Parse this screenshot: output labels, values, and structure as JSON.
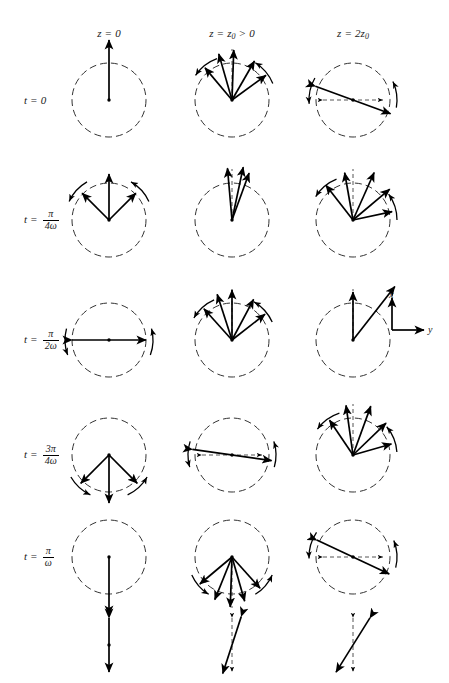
{
  "figure": {
    "background": "#ffffff",
    "ink_color": "#000000",
    "dashed_color": "#555555"
  },
  "columns": [
    {
      "id": "z0",
      "label_plain": "z = 0",
      "var": "z",
      "eq": "=",
      "value": "0",
      "center_x": 109
    },
    {
      "id": "zz0",
      "label_plain": "z = z0 > 0",
      "var": "z",
      "eq": "=",
      "value": "z",
      "sub": "0",
      "rel": ">",
      "rel_value": "0",
      "center_x": 232
    },
    {
      "id": "z2z0",
      "label_plain": "z = 2z0",
      "var": "z",
      "eq": "=",
      "value": "2z",
      "sub": "0",
      "center_x": 353
    }
  ],
  "column_header_y": 27,
  "rows": [
    {
      "id": "t0",
      "label_plain": "t = 0",
      "var": "t",
      "eq": "=",
      "kind": "plain",
      "value": "0",
      "center_y": 100
    },
    {
      "id": "tpi4w",
      "label_plain": "t = pi/4w",
      "var": "t",
      "eq": "=",
      "kind": "frac",
      "num": "π",
      "den": "4ω",
      "center_y": 220
    },
    {
      "id": "tpi2w",
      "label_plain": "t = pi/2w",
      "var": "t",
      "eq": "=",
      "kind": "frac",
      "num": "π",
      "den": "2ω",
      "center_y": 340
    },
    {
      "id": "t3pi4w",
      "label_plain": "t = 3pi/4w",
      "var": "t",
      "eq": "=",
      "kind": "frac",
      "num": "3π",
      "den": "4ω",
      "center_y": 455
    },
    {
      "id": "tpiw",
      "label_plain": "t = pi/w",
      "var": "t",
      "eq": "=",
      "kind": "frac",
      "num": "π",
      "den": "ω",
      "center_y": 557
    }
  ],
  "row_label_x": 24,
  "circle_radius": 37,
  "axes_legend": {
    "x_label": "x",
    "y_label": "y",
    "origin_x": 392,
    "origin_y": 330,
    "x_arrow_length": 32,
    "y_arrow_length": 32
  },
  "summary_row": {
    "center_y": 645,
    "items": [
      {
        "id": "sum-z0",
        "description": "linear vertical double arrow",
        "center_x": 109
      },
      {
        "id": "sum-zz0",
        "description": "narrow crossed double arrows",
        "center_x": 232
      },
      {
        "id": "sum-z2z0",
        "description": "wide crossed double arrows",
        "center_x": 353
      }
    ]
  },
  "cells": [
    {
      "row": "t0",
      "col": "z0",
      "name": "cell-t0-z0",
      "description": "single long vertical arrow pointing up from center",
      "vectors": [
        {
          "angle_deg": 90,
          "length": 60
        }
      ],
      "arcs": []
    },
    {
      "row": "t0",
      "col": "zz0",
      "name": "cell-t0-zz0",
      "description": "fan of five arrows spanning upper half, tangential arc arrows",
      "vectors": [
        {
          "angle_deg": 130,
          "length": 42
        },
        {
          "angle_deg": 106,
          "length": 48
        },
        {
          "angle_deg": 88,
          "length": 50
        },
        {
          "angle_deg": 60,
          "length": 45
        },
        {
          "angle_deg": 36,
          "length": 42
        }
      ],
      "dashed_ref_angle_deg": 90,
      "arcs": [
        {
          "start_deg": 110,
          "end_deg": 146,
          "dir": "ccw"
        },
        {
          "start_deg": 22,
          "end_deg": 58,
          "dir": "cw"
        }
      ]
    },
    {
      "row": "t0",
      "col": "z2z0",
      "name": "cell-t0-z2z0",
      "description": "diagonal double-headed arrow plus horizontal dashed double arrow",
      "double_vectors": [
        {
          "angle_deg": 160,
          "length": 40
        }
      ],
      "dashed_double": {
        "angle_deg": 180,
        "length": 30
      },
      "arcs": [
        {
          "start_deg": 150,
          "end_deg": 185,
          "dir": "ccw"
        },
        {
          "start_deg": -10,
          "end_deg": 25,
          "dir": "cw"
        }
      ]
    },
    {
      "row": "tpi4w",
      "col": "z0",
      "name": "cell-tpi4w-z0",
      "description": "two symmetric arrows forming a V with central vertical arrow",
      "vectors": [
        {
          "angle_deg": 135,
          "length": 38
        },
        {
          "angle_deg": 90,
          "length": 46
        },
        {
          "angle_deg": 45,
          "length": 38
        }
      ],
      "arcs": [
        {
          "start_deg": 120,
          "end_deg": 155,
          "dir": "ccw"
        },
        {
          "start_deg": 25,
          "end_deg": 60,
          "dir": "cw"
        }
      ]
    },
    {
      "row": "tpi4w",
      "col": "zz0",
      "name": "cell-tpi4w-zz0",
      "description": "tight cluster of near vertical arrows tilted right",
      "vectors": [
        {
          "angle_deg": 95,
          "length": 52
        },
        {
          "angle_deg": 78,
          "length": 54
        },
        {
          "angle_deg": 70,
          "length": 50
        }
      ],
      "dashed_ref_angle_deg": 90,
      "arcs": []
    },
    {
      "row": "tpi4w",
      "col": "z2z0",
      "name": "cell-tpi4w-z2z0",
      "description": "wide fan of arrows from center toward upper right with arcs",
      "vectors": [
        {
          "angle_deg": 128,
          "length": 44
        },
        {
          "angle_deg": 100,
          "length": 48
        },
        {
          "angle_deg": 66,
          "length": 52
        },
        {
          "angle_deg": 40,
          "length": 48
        },
        {
          "angle_deg": 12,
          "length": 40
        }
      ],
      "dashed_ref_angle_deg": 90,
      "arcs": [
        {
          "start_deg": 112,
          "end_deg": 148,
          "dir": "ccw"
        },
        {
          "start_deg": 0,
          "end_deg": 36,
          "dir": "cw"
        }
      ]
    },
    {
      "row": "tpi2w",
      "col": "z0",
      "name": "cell-tpi2w-z0",
      "description": "horizontal double-headed arrow through center",
      "double_vectors": [
        {
          "angle_deg": 180,
          "length": 37
        }
      ],
      "arcs": [
        {
          "start_deg": 165,
          "end_deg": 200,
          "dir": "ccw"
        },
        {
          "start_deg": -20,
          "end_deg": 15,
          "dir": "cw"
        }
      ]
    },
    {
      "row": "tpi2w",
      "col": "zz0",
      "name": "cell-tpi2w-zz0",
      "description": "fan of five arrows upward, same pattern as t=0 z=z0",
      "vectors": [
        {
          "angle_deg": 132,
          "length": 42
        },
        {
          "angle_deg": 108,
          "length": 48
        },
        {
          "angle_deg": 90,
          "length": 50
        },
        {
          "angle_deg": 62,
          "length": 46
        },
        {
          "angle_deg": 38,
          "length": 42
        }
      ],
      "dashed_ref_angle_deg": 90,
      "arcs": [
        {
          "start_deg": 114,
          "end_deg": 150,
          "dir": "ccw"
        },
        {
          "start_deg": 24,
          "end_deg": 60,
          "dir": "cw"
        }
      ]
    },
    {
      "row": "tpi2w",
      "col": "z2z0",
      "name": "cell-tpi2w-z2z0",
      "description": "long arrow to upper right and short vertical arrow",
      "vectors": [
        {
          "angle_deg": 90,
          "length": 48
        },
        {
          "angle_deg": 52,
          "length": 68
        }
      ],
      "dashed_ref_angle_deg": 90,
      "arcs": []
    },
    {
      "row": "t3pi4w",
      "col": "z0",
      "name": "cell-t3pi4w-z0",
      "description": "inverted V of two arrows with central downward arrow",
      "vectors": [
        {
          "angle_deg": -135,
          "length": 40
        },
        {
          "angle_deg": -90,
          "length": 48
        },
        {
          "angle_deg": -45,
          "length": 40
        }
      ],
      "arcs": [
        {
          "start_deg": -150,
          "end_deg": -115,
          "dir": "cw"
        },
        {
          "start_deg": -65,
          "end_deg": -30,
          "dir": "ccw"
        }
      ]
    },
    {
      "row": "t3pi4w",
      "col": "zz0",
      "name": "cell-t3pi4w-zz0",
      "description": "shallow diagonal double arrow with dashed horizontal double arrow",
      "double_vectors": [
        {
          "angle_deg": 172,
          "length": 40
        }
      ],
      "dashed_double": {
        "angle_deg": 180,
        "length": 30
      },
      "arcs": [
        {
          "start_deg": 162,
          "end_deg": 196,
          "dir": "ccw"
        },
        {
          "start_deg": -16,
          "end_deg": 18,
          "dir": "cw"
        }
      ]
    },
    {
      "row": "t3pi4w",
      "col": "z2z0",
      "name": "cell-t3pi4w-z2z0",
      "description": "fan of arrows toward upper right with tangential arcs",
      "vectors": [
        {
          "angle_deg": 124,
          "length": 42
        },
        {
          "angle_deg": 98,
          "length": 50
        },
        {
          "angle_deg": 70,
          "length": 52
        },
        {
          "angle_deg": 44,
          "length": 46
        },
        {
          "angle_deg": 16,
          "length": 40
        }
      ],
      "dashed_ref_angle_deg": 90,
      "arcs": [
        {
          "start_deg": 108,
          "end_deg": 144,
          "dir": "ccw"
        },
        {
          "start_deg": 4,
          "end_deg": 40,
          "dir": "cw"
        }
      ]
    },
    {
      "row": "tpiw",
      "col": "z0",
      "name": "cell-tpiw-z0",
      "description": "single long vertical arrow pointing down from center",
      "vectors": [
        {
          "angle_deg": -90,
          "length": 58
        }
      ],
      "arcs": []
    },
    {
      "row": "tpiw",
      "col": "zz0",
      "name": "cell-tpiw-zz0",
      "description": "downward fan of arrows with arcs",
      "vectors": [
        {
          "angle_deg": -140,
          "length": 42
        },
        {
          "angle_deg": -112,
          "length": 46
        },
        {
          "angle_deg": -92,
          "length": 50
        },
        {
          "angle_deg": -74,
          "length": 46
        },
        {
          "angle_deg": -48,
          "length": 42
        }
      ],
      "dashed_ref_angle_deg": -90,
      "arcs": [
        {
          "start_deg": -156,
          "end_deg": -122,
          "dir": "cw"
        },
        {
          "start_deg": -58,
          "end_deg": -24,
          "dir": "ccw"
        }
      ]
    },
    {
      "row": "tpiw",
      "col": "z2z0",
      "name": "cell-tpiw-z2z0",
      "description": "diagonal double arrow with dashed horizontal double arrow",
      "double_vectors": [
        {
          "angle_deg": 155,
          "length": 40
        }
      ],
      "dashed_double": {
        "angle_deg": 180,
        "length": 30
      },
      "arcs": [
        {
          "start_deg": 146,
          "end_deg": 182,
          "dir": "ccw"
        },
        {
          "start_deg": -14,
          "end_deg": 22,
          "dir": "cw"
        }
      ]
    }
  ]
}
